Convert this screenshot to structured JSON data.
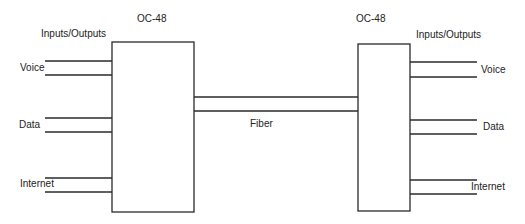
{
  "diagram": {
    "left_node": {
      "title": "OC-48",
      "io_label": "Inputs/Outputs",
      "ports": [
        {
          "label": "Voice"
        },
        {
          "label": "Data"
        },
        {
          "label": "Internet"
        }
      ]
    },
    "right_node": {
      "title": "OC-48",
      "io_label": "Inputs/Outputs",
      "ports": [
        {
          "label": "Voice"
        },
        {
          "label": "Data"
        },
        {
          "label": "Internet"
        }
      ]
    },
    "link": {
      "label": "Fiber"
    },
    "colors": {
      "stroke": "#2a2a2a",
      "text": "#222222",
      "background": "#ffffff"
    }
  }
}
